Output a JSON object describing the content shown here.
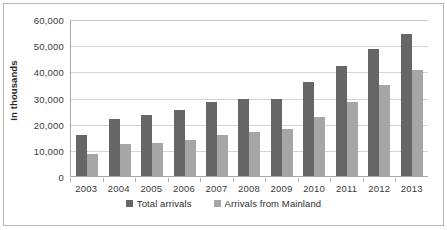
{
  "chart_data": {
    "type": "bar",
    "title": "",
    "subtitle": "",
    "xlabel": "",
    "ylabel": "In thousands",
    "categories": [
      "2003",
      "2004",
      "2005",
      "2006",
      "2007",
      "2008",
      "2009",
      "2010",
      "2011",
      "2012",
      "2013"
    ],
    "series": [
      {
        "name": "Total arrivals",
        "color": "#666666",
        "values": [
          15500,
          21800,
          23400,
          25300,
          28200,
          29500,
          29600,
          36000,
          41900,
          48600,
          54300
        ]
      },
      {
        "name": "Arrivals from Mainland",
        "color": "#a6a6a6",
        "values": [
          8500,
          12200,
          12500,
          13600,
          15500,
          16900,
          17900,
          22700,
          28100,
          34900,
          40700
        ]
      }
    ],
    "ylim": [
      0,
      60000
    ],
    "ytick_values": [
      0,
      10000,
      20000,
      30000,
      40000,
      50000,
      60000
    ],
    "ytick_labels": [
      "0",
      "10,000",
      "20,000",
      "30,000",
      "40,000",
      "50,000",
      "60,000"
    ],
    "grid": true,
    "grid_axis": "y",
    "legend_position": "bottom",
    "bar_mode": "grouped"
  },
  "legend": {
    "items": [
      {
        "label": "Total arrivals",
        "key": "total"
      },
      {
        "label": "Arrivals from Mainland",
        "key": "mainland"
      }
    ]
  }
}
